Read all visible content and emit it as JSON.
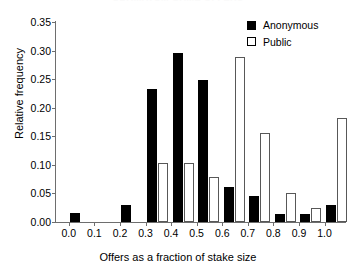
{
  "figure": {
    "cropped_title_sliver": "ULTIMATUM GAME OFFERS"
  },
  "chart_data": {
    "type": "bar",
    "title": "",
    "xlabel": "Offers as a fraction of stake size",
    "ylabel": "Relative frequency",
    "categories": [
      "0.0",
      "0.1",
      "0.2",
      "0.3",
      "0.4",
      "0.5",
      "0.6",
      "0.7",
      "0.8",
      "0.9",
      "1.0"
    ],
    "series": [
      {
        "name": "Anonymous",
        "color": "#000000",
        "fill": "solid",
        "values": [
          0.015,
          0.0,
          0.03,
          0.233,
          0.295,
          0.248,
          0.061,
          0.045,
          0.014,
          0.014,
          0.029
        ]
      },
      {
        "name": "Public",
        "color": "#ffffff",
        "fill": "open",
        "values": [
          0.0,
          0.0,
          0.0,
          0.104,
          0.104,
          0.078,
          0.288,
          0.156,
          0.051,
          0.024,
          0.182
        ]
      }
    ],
    "ylim": [
      0.0,
      0.35
    ],
    "yticks": [
      "0.00",
      "0.05",
      "0.10",
      "0.15",
      "0.20",
      "0.25",
      "0.30",
      "0.35"
    ],
    "ytick_values": [
      0.0,
      0.05,
      0.1,
      0.15,
      0.2,
      0.25,
      0.3,
      0.35
    ],
    "xlim": [
      -0.05,
      1.08
    ],
    "xticks": [
      "0.0",
      "0.1",
      "0.2",
      "0.3",
      "0.4",
      "0.5",
      "0.6",
      "0.7",
      "0.8",
      "0.9",
      "1.0"
    ],
    "xtick_values": [
      0.0,
      0.1,
      0.2,
      0.3,
      0.4,
      0.5,
      0.6,
      0.7,
      0.8,
      0.9,
      1.0
    ],
    "grid": false,
    "legend_position": "top-right",
    "legend": [
      "Anonymous",
      "Public"
    ]
  }
}
